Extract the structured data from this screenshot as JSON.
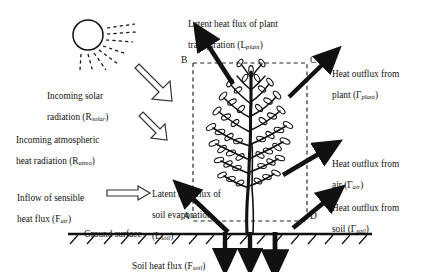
{
  "figure": {
    "type": "energy-balance-schematic"
  },
  "labels": {
    "solar": {
      "text": "Incoming  solar\nradiation (Rsolar)",
      "line1": "Incoming   solar",
      "line2_pre": "radiation (R",
      "line2_sub": "solar",
      "line2_post": ")"
    },
    "atmo": {
      "line1": "Incoming  atmospheric",
      "line2_pre": "heat radiation (R",
      "line2_sub": "atmo",
      "line2_post": ")"
    },
    "sensible": {
      "line1": "Inflow  of  sensible",
      "line2_pre": "heat flux (F",
      "line2_sub": "air",
      "line2_post": ")"
    },
    "latent_soil": {
      "line1": "Latent heat flux of",
      "line2": "soil evaporation",
      "line3_pre": "(L",
      "line3_sub": "soil",
      "line3_post": ")"
    },
    "latent_plant": {
      "line1": "Latent heat flux of plant",
      "line2_pre": "transpiration (L",
      "line2_sub": "plant",
      "line2_post": ")"
    },
    "out_plant": {
      "line1": "Heat  outflux  from",
      "line2_pre": "plant (Γ",
      "line2_sub": "plant",
      "line2_post": ")"
    },
    "out_air": {
      "line1": "Heat  outflux  from",
      "line2_pre": "air (Γ",
      "line2_sub": "air",
      "line2_post": ")"
    },
    "out_soil": {
      "line1": "Heat  outflux  from",
      "line2_pre": "soil (Γ",
      "line2_sub": "soil",
      "line2_post": ")"
    },
    "ground_surface": "Ground surface",
    "soil_heat_flux": {
      "pre": "Soil heat flux (F",
      "sub": "soil",
      "post": ")"
    }
  },
  "corners": {
    "b": "B",
    "c": "C",
    "a": "A",
    "d": "D"
  },
  "symbols": {
    "R_solar": "Rsolar",
    "R_atmo": "Ratmo",
    "F_air": "Fair",
    "L_soil": "Lsoil",
    "L_plant": "Lplant",
    "Gamma_plant": "Γplant",
    "Gamma_air": "Γair",
    "Gamma_soil": "Γsoil",
    "F_soil": "Fsoil"
  },
  "colors": {
    "ink": "#111111",
    "background": "#ffffff",
    "dashed_box": "#222222",
    "arrow_solid": "#111111"
  },
  "control_volume": {
    "left": 193,
    "right": 307,
    "top": 63,
    "bottom": 221,
    "style": "dashed"
  },
  "ground": {
    "y": 234,
    "hatch_count": 18
  },
  "soil_flux_arrows": [
    225,
    250,
    275
  ]
}
